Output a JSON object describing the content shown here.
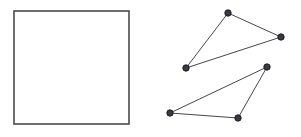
{
  "figure": {
    "background_color": "#ffffff",
    "width": 301,
    "height": 137
  },
  "grid": {
    "name": "square-grid",
    "columns": 8,
    "rows": 8,
    "x": 14,
    "y": 11,
    "width": 115,
    "height": 113,
    "cell_width": 14.375,
    "cell_height": 14.125,
    "border_color": "#4a4a4a",
    "line_color": "#9a9a9a",
    "fill_color": "#ffffff"
  },
  "shapes": {
    "edge_color": "#46464c",
    "vertex_fill": "#3a3a42",
    "vertex_stroke": "#15151a",
    "vertex_radius": 3.2,
    "polygons": [
      {
        "name": "upper-triangle",
        "sides": 3,
        "points": "228,13 281,37 186,68",
        "vertices": [
          {
            "label": "apex",
            "x": 228,
            "y": 13
          },
          {
            "label": "right",
            "x": 281,
            "y": 37
          },
          {
            "label": "lower-left",
            "x": 186,
            "y": 68
          }
        ]
      },
      {
        "name": "lower-triangle",
        "sides": 3,
        "points": "267,67 238,118 170,113",
        "vertices": [
          {
            "label": "apex",
            "x": 267,
            "y": 67
          },
          {
            "label": "bottom-right",
            "x": 238,
            "y": 118
          },
          {
            "label": "bottom-left",
            "x": 170,
            "y": 113
          }
        ]
      }
    ]
  }
}
